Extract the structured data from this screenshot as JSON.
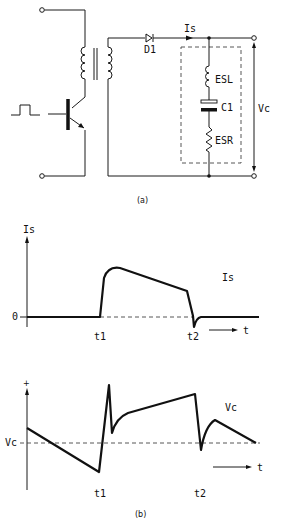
{
  "circuit": {
    "diode_label": "D1",
    "current_label": "Is",
    "esl_label": "ESL",
    "cap_label": "C1",
    "esr_label": "ESR",
    "voltage_label": "Vc",
    "caption": "(a)"
  },
  "graph_current": {
    "y_axis_label": "Is",
    "zero_label": "0",
    "t1_label": "t1",
    "t2_label": "t2",
    "time_label": "t",
    "curve_label": "Is"
  },
  "graph_voltage": {
    "plus_label": "+",
    "ref_label": "Vc",
    "t1_label": "t1",
    "t2_label": "t2",
    "time_label": "t",
    "curve_label": "Vc",
    "caption": "(b)"
  }
}
